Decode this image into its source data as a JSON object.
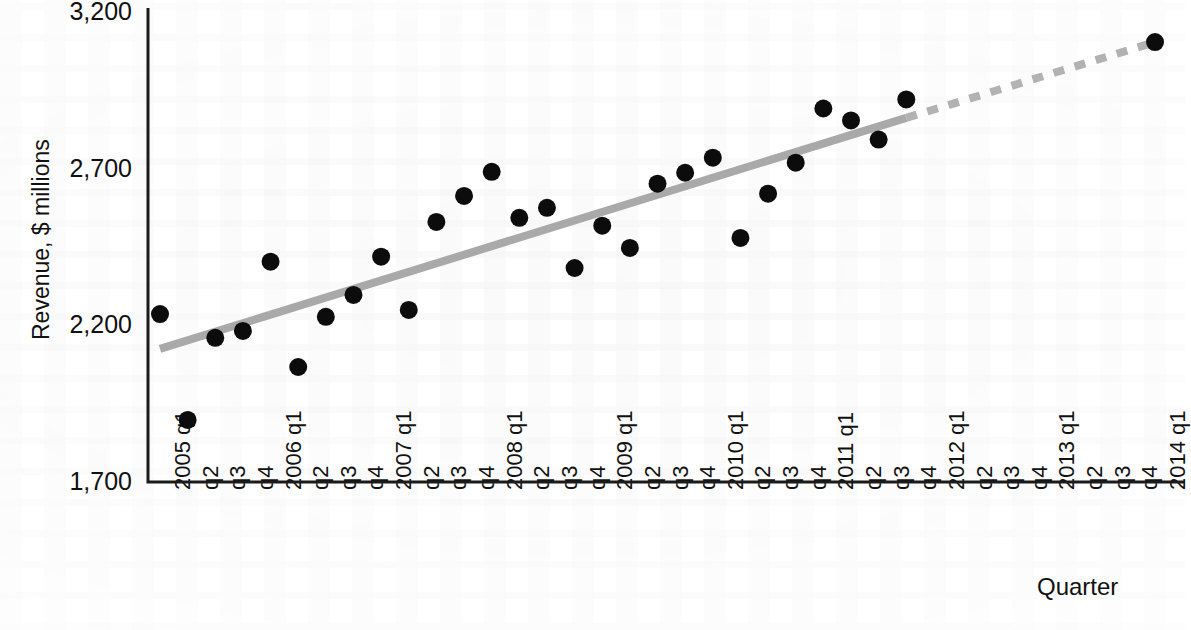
{
  "chart_data": {
    "type": "scatter",
    "title": "",
    "xlabel": "Quarter",
    "ylabel": "Revenue, $ millions",
    "ylim": [
      1700,
      3200
    ],
    "yticks": [
      "1,700",
      "2,200",
      "2,700",
      "3,200"
    ],
    "ytick_values": [
      1700,
      2200,
      2700,
      3200
    ],
    "grid": false,
    "legend": "none",
    "categories": [
      "2005 q1",
      "q2",
      "q3",
      "q4",
      "2006 q1",
      "q2",
      "q3",
      "q4",
      "2007 q1",
      "q2",
      "q3",
      "q4",
      "2008 q1",
      "q2",
      "q3",
      "q4",
      "2009 q1",
      "q2",
      "q3",
      "q4",
      "2010 q1",
      "q2",
      "q3",
      "q4",
      "2011 q1",
      "q2",
      "q3",
      "q4",
      "2012 q1",
      "q2",
      "q3",
      "q4",
      "2013 q1",
      "q2",
      "q3",
      "q4",
      "2014 q1"
    ],
    "series": [
      {
        "name": "Revenue",
        "marker": "filled-circle",
        "color": "#0c0c0c",
        "points": [
          {
            "x": "2005 q1",
            "index": 0,
            "y": 2236
          },
          {
            "x": "q2",
            "index": 1,
            "y": 1898
          },
          {
            "x": "q3",
            "index": 2,
            "y": 2160
          },
          {
            "x": "q4",
            "index": 3,
            "y": 2182
          },
          {
            "x": "2006 q1",
            "index": 4,
            "y": 2403
          },
          {
            "x": "q2",
            "index": 5,
            "y": 2067
          },
          {
            "x": "q3",
            "index": 6,
            "y": 2227
          },
          {
            "x": "q4",
            "index": 7,
            "y": 2297
          },
          {
            "x": "2007 q1",
            "index": 8,
            "y": 2419
          },
          {
            "x": "q2",
            "index": 9,
            "y": 2249
          },
          {
            "x": "q3",
            "index": 10,
            "y": 2530
          },
          {
            "x": "q4",
            "index": 11,
            "y": 2613
          },
          {
            "x": "2008 q1",
            "index": 12,
            "y": 2690
          },
          {
            "x": "q2",
            "index": 13,
            "y": 2543
          },
          {
            "x": "q3",
            "index": 14,
            "y": 2575
          },
          {
            "x": "q4",
            "index": 15,
            "y": 2383
          },
          {
            "x": "2009 q1",
            "index": 16,
            "y": 2518
          },
          {
            "x": "q2",
            "index": 17,
            "y": 2447
          },
          {
            "x": "q3",
            "index": 18,
            "y": 2652
          },
          {
            "x": "q4",
            "index": 19,
            "y": 2687
          },
          {
            "x": "2010 q1",
            "index": 20,
            "y": 2735
          },
          {
            "x": "q2",
            "index": 21,
            "y": 2479
          },
          {
            "x": "q3",
            "index": 22,
            "y": 2620
          },
          {
            "x": "q4",
            "index": 23,
            "y": 2719
          },
          {
            "x": "2011 q1",
            "index": 24,
            "y": 2892
          },
          {
            "x": "q2",
            "index": 25,
            "y": 2854
          },
          {
            "x": "q3",
            "index": 26,
            "y": 2793
          },
          {
            "x": "q4",
            "index": 27,
            "y": 2921
          },
          {
            "x": "2014 q1",
            "index": 36,
            "y": 3104
          }
        ]
      }
    ],
    "trendline": {
      "name": "Trend",
      "color": "#a9a9a9",
      "solid_from": {
        "index": 0,
        "y": 2125
      },
      "solid_to": {
        "index": 27,
        "y": 2862
      },
      "dashed_from": {
        "index": 27,
        "y": 2862
      },
      "dashed_to": {
        "index": 36,
        "y": 3104
      },
      "style_solid": "solid",
      "style_forecast": "dashed"
    }
  }
}
